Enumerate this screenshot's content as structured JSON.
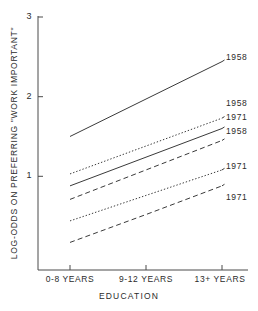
{
  "chart_data": {
    "type": "line",
    "title": "",
    "xlabel": "EDUCATION",
    "ylabel": "LOG-ODDS ON PREFERRING \"WORK IMPORTANT\"",
    "categories": [
      "0-8 YEARS",
      "9-12 YEARS",
      "13+ YEARS"
    ],
    "x_tick_labels": [
      "0-8 YEARS",
      "9-12 YEARS",
      "13+ YEARS"
    ],
    "y_tick_labels": [
      "1",
      "2",
      "3"
    ],
    "ylim": [
      0,
      3
    ],
    "yticks": [
      1,
      2,
      3
    ],
    "grid": false,
    "legend_position": "right-inline",
    "series": [
      {
        "name": "1958",
        "line_style": "solid",
        "label": "1958",
        "values": [
          1.5,
          1.97,
          2.44
        ]
      },
      {
        "name": "1958",
        "line_style": "dotted",
        "label": "1958",
        "values": [
          1.03,
          1.38,
          1.73
        ]
      },
      {
        "name": "1971",
        "line_style": "solid",
        "label": "1971",
        "values": [
          0.88,
          1.24,
          1.6
        ]
      },
      {
        "name": "1958",
        "line_style": "dashed",
        "label": "1958",
        "values": [
          0.71,
          1.08,
          1.45
        ]
      },
      {
        "name": "1971",
        "line_style": "dotted",
        "label": "1971",
        "values": [
          0.44,
          0.76,
          1.08
        ]
      },
      {
        "name": "1971",
        "line_style": "dashed",
        "label": "1971",
        "values": [
          0.17,
          0.52,
          0.88
        ]
      }
    ]
  },
  "axis": {
    "y_title": "LOG-ODDS ON PREFERRING \"WORK IMPORTANT\"",
    "x_title": "EDUCATION",
    "y_ticks": [
      {
        "label": "3"
      },
      {
        "label": "2"
      },
      {
        "label": "1"
      }
    ],
    "x_ticks": [
      {
        "label": "0-8 YEARS"
      },
      {
        "label": "9-12 YEARS"
      },
      {
        "label": "13+ YEARS"
      }
    ]
  },
  "series_labels": [
    {
      "text": "1958"
    },
    {
      "text": "1958"
    },
    {
      "text": "1971"
    },
    {
      "text": "1958"
    },
    {
      "text": "1971"
    },
    {
      "text": "1971"
    }
  ],
  "colors": {
    "axis": "#4a4a4a",
    "line": "#3a3a3a",
    "text": "#2b2b2b",
    "background": "#ffffff"
  }
}
